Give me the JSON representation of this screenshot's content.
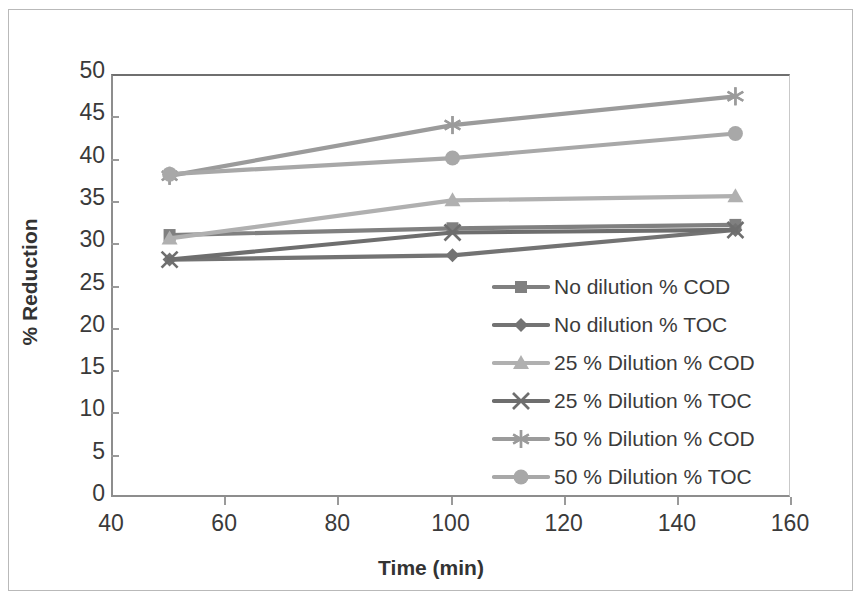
{
  "chart_data": {
    "type": "line",
    "title": "",
    "xlabel": "Time (min)",
    "ylabel": "% Reduction",
    "xlim": [
      40,
      160
    ],
    "ylim": [
      0,
      50
    ],
    "x": [
      50,
      100,
      150
    ],
    "xticks": [
      40,
      60,
      80,
      100,
      120,
      140,
      160
    ],
    "yticks": [
      0,
      5,
      10,
      15,
      20,
      25,
      30,
      35,
      40,
      45,
      50
    ],
    "grid": false,
    "legend_position": "center-right-inside",
    "series": [
      {
        "name": "No dilution % COD",
        "marker": "square",
        "color": "#808080",
        "values": [
          31.2,
          32.0,
          32.4
        ]
      },
      {
        "name": "No dilution % TOC",
        "marker": "diamond",
        "color": "#737373",
        "values": [
          28.3,
          28.8,
          31.8
        ]
      },
      {
        "name": "25 % Dilution % COD",
        "marker": "triangle",
        "color": "#b0b0b0",
        "values": [
          30.8,
          35.3,
          35.8
        ]
      },
      {
        "name": "25 % Dilution % TOC",
        "marker": "x",
        "color": "#6e6e6e",
        "values": [
          28.3,
          31.5,
          31.8
        ]
      },
      {
        "name": "50 % Dilution % COD",
        "marker": "asterisk",
        "color": "#9b9b9b",
        "values": [
          38.2,
          44.2,
          47.6
        ]
      },
      {
        "name": "50 % Dilution % TOC",
        "marker": "circle",
        "color": "#a8a8a8",
        "values": [
          38.4,
          40.3,
          43.2
        ]
      }
    ]
  },
  "axes": {
    "y_tick_labels": [
      "50",
      "45",
      "40",
      "35",
      "30",
      "25",
      "20",
      "15",
      "10",
      "5",
      "0"
    ],
    "x_tick_labels": [
      "40",
      "60",
      "80",
      "100",
      "120",
      "140",
      "160"
    ],
    "x_title": "Time (min)",
    "y_title": "% Reduction"
  },
  "legend": {
    "items": [
      {
        "label": "No dilution % COD",
        "marker": "square",
        "color": "#808080"
      },
      {
        "label": "No dilution % TOC",
        "marker": "diamond",
        "color": "#737373"
      },
      {
        "label": "25 % Dilution % COD",
        "marker": "triangle",
        "color": "#b0b0b0"
      },
      {
        "label": "25 % Dilution % TOC",
        "marker": "x",
        "color": "#6e6e6e"
      },
      {
        "label": "50 % Dilution % COD",
        "marker": "asterisk",
        "color": "#9b9b9b"
      },
      {
        "label": "50 % Dilution % TOC",
        "marker": "circle",
        "color": "#a8a8a8"
      }
    ]
  }
}
